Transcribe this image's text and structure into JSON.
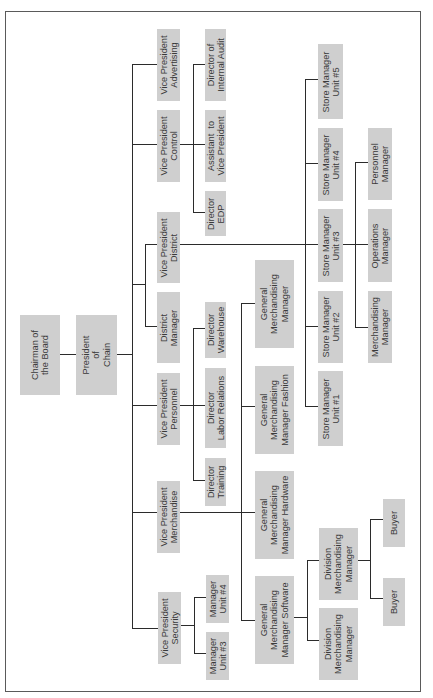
{
  "diagram": {
    "orientation": "rotated-90-ccw",
    "colors": {
      "box_fill": "#cfcfcf",
      "line": "#2b2b2b",
      "text": "#3a3a3a",
      "frame": "#5a5a5a"
    },
    "frame": {
      "x": 5,
      "y": 11,
      "w": 416,
      "h": 681
    },
    "nodes": [
      {
        "id": "chairman",
        "label": "Chairman of\nthe Board",
        "x": 20,
        "y": 315,
        "w": 40,
        "h": 80
      },
      {
        "id": "president",
        "label": "President\nof\nChain",
        "x": 76,
        "y": 315,
        "w": 41,
        "h": 80
      },
      {
        "id": "vp-advertising",
        "label": "Vice President\nAdvertising",
        "x": 157,
        "y": 29,
        "w": 23,
        "h": 72
      },
      {
        "id": "vp-control",
        "label": "Vice President\nControl",
        "x": 157,
        "y": 110,
        "w": 23,
        "h": 72
      },
      {
        "id": "vp-district",
        "label": "Vice President\nDistrict",
        "x": 157,
        "y": 212,
        "w": 23,
        "h": 71
      },
      {
        "id": "district-manager",
        "label": "District\nManager",
        "x": 157,
        "y": 292,
        "w": 23,
        "h": 71
      },
      {
        "id": "vp-personnel",
        "label": "Vice President\nPersonnel",
        "x": 157,
        "y": 373,
        "w": 23,
        "h": 72
      },
      {
        "id": "vp-merchandise",
        "label": "Vice President\nMerchandise",
        "x": 157,
        "y": 481,
        "w": 23,
        "h": 72
      },
      {
        "id": "vp-security",
        "label": "Vice President\nSecurity",
        "x": 158,
        "y": 592,
        "w": 23,
        "h": 72
      },
      {
        "id": "dir-internal-audit",
        "label": "Director of\nInternal Audit",
        "x": 205,
        "y": 29,
        "w": 21,
        "h": 72
      },
      {
        "id": "assistant-vp",
        "label": "Assistant  to\nVice President",
        "x": 205,
        "y": 110,
        "w": 21,
        "h": 72
      },
      {
        "id": "dir-edp",
        "label": "Director\nEDP",
        "x": 205,
        "y": 191,
        "w": 21,
        "h": 45
      },
      {
        "id": "dir-warehouse",
        "label": "Director\nWarehouse",
        "x": 205,
        "y": 302,
        "w": 21,
        "h": 56
      },
      {
        "id": "dir-labor",
        "label": "Director\nLabor Relations",
        "x": 205,
        "y": 368,
        "w": 21,
        "h": 80
      },
      {
        "id": "dir-training",
        "label": "Director\nTraining",
        "x": 205,
        "y": 458,
        "w": 21,
        "h": 48
      },
      {
        "id": "mgr-unit-4",
        "label": "Manager\nUnit #4",
        "x": 206,
        "y": 575,
        "w": 23,
        "h": 48
      },
      {
        "id": "mgr-unit-3",
        "label": "Manager\nUnit #3",
        "x": 206,
        "y": 632,
        "w": 23,
        "h": 48
      },
      {
        "id": "gmm",
        "label": "General\nMerchandising\nManager",
        "x": 255,
        "y": 260,
        "w": 39,
        "h": 88
      },
      {
        "id": "gmm-fashion",
        "label": "General\nMerchandising\nManager Fashion",
        "x": 255,
        "y": 366,
        "w": 39,
        "h": 88
      },
      {
        "id": "gmm-hardware",
        "label": "General\nMerchandising\nManager Hardware",
        "x": 255,
        "y": 471,
        "w": 39,
        "h": 88
      },
      {
        "id": "gmm-software",
        "label": "General\nMerchandising\nManager Software",
        "x": 255,
        "y": 576,
        "w": 39,
        "h": 88
      },
      {
        "id": "store-mgr-5",
        "label": "Store Manager\nUnit #5",
        "x": 318,
        "y": 44,
        "w": 25,
        "h": 75
      },
      {
        "id": "store-mgr-4",
        "label": "Store Manager\nUnit #4",
        "x": 318,
        "y": 128,
        "w": 25,
        "h": 73
      },
      {
        "id": "store-mgr-3",
        "label": "Store Manager\nUnit #3",
        "x": 318,
        "y": 209,
        "w": 25,
        "h": 73
      },
      {
        "id": "store-mgr-2",
        "label": "Store Manager\nUnit #2",
        "x": 318,
        "y": 291,
        "w": 25,
        "h": 72
      },
      {
        "id": "store-mgr-1",
        "label": "Store Manager\nUnit #1",
        "x": 318,
        "y": 371,
        "w": 25,
        "h": 75
      },
      {
        "id": "personnel-manager",
        "label": "Personnel\nManager",
        "x": 368,
        "y": 128,
        "w": 24,
        "h": 72
      },
      {
        "id": "operations-manager",
        "label": "Operations\nManager",
        "x": 368,
        "y": 209,
        "w": 24,
        "h": 73
      },
      {
        "id": "merchandising-manager",
        "label": "Merchandising\nManager",
        "x": 368,
        "y": 291,
        "w": 24,
        "h": 72
      },
      {
        "id": "division-mm-1",
        "label": "Division\nMerchandising\nManager",
        "x": 319,
        "y": 528,
        "w": 39,
        "h": 72
      },
      {
        "id": "division-mm-2",
        "label": "Division\nMerchandising\nManager",
        "x": 319,
        "y": 608,
        "w": 39,
        "h": 72
      },
      {
        "id": "buyer-1",
        "label": "Buyer",
        "x": 383,
        "y": 499,
        "w": 22,
        "h": 48
      },
      {
        "id": "buyer-2",
        "label": "Buyer",
        "x": 383,
        "y": 578,
        "w": 22,
        "h": 48
      }
    ],
    "lines": [
      {
        "x": 60,
        "y": 354,
        "w": 16,
        "h": 1
      },
      {
        "x": 117,
        "y": 354,
        "w": 16,
        "h": 1
      },
      {
        "x": 132,
        "y": 64,
        "w": 1,
        "h": 565
      },
      {
        "x": 132,
        "y": 64,
        "w": 25,
        "h": 1
      },
      {
        "x": 132,
        "y": 144,
        "w": 25,
        "h": 1
      },
      {
        "x": 132,
        "y": 284,
        "w": 13,
        "h": 1
      },
      {
        "x": 145,
        "y": 244,
        "w": 1,
        "h": 83
      },
      {
        "x": 145,
        "y": 244,
        "w": 12,
        "h": 1
      },
      {
        "x": 145,
        "y": 326,
        "w": 12,
        "h": 1
      },
      {
        "x": 132,
        "y": 405,
        "w": 25,
        "h": 1
      },
      {
        "x": 132,
        "y": 512,
        "w": 25,
        "h": 1
      },
      {
        "x": 132,
        "y": 628,
        "w": 26,
        "h": 1
      },
      {
        "x": 180,
        "y": 144,
        "w": 13,
        "h": 1
      },
      {
        "x": 193,
        "y": 64,
        "w": 1,
        "h": 149
      },
      {
        "x": 193,
        "y": 64,
        "w": 12,
        "h": 1
      },
      {
        "x": 193,
        "y": 144,
        "w": 12,
        "h": 1
      },
      {
        "x": 193,
        "y": 212,
        "w": 12,
        "h": 1
      },
      {
        "x": 180,
        "y": 244,
        "w": 191,
        "h": 1
      },
      {
        "x": 180,
        "y": 405,
        "w": 13,
        "h": 1
      },
      {
        "x": 193,
        "y": 328,
        "w": 1,
        "h": 153
      },
      {
        "x": 193,
        "y": 328,
        "w": 12,
        "h": 1
      },
      {
        "x": 193,
        "y": 405,
        "w": 12,
        "h": 1
      },
      {
        "x": 193,
        "y": 480,
        "w": 12,
        "h": 1
      },
      {
        "x": 180,
        "y": 512,
        "w": 75,
        "h": 1
      },
      {
        "x": 241,
        "y": 303,
        "w": 1,
        "h": 318
      },
      {
        "x": 241,
        "y": 303,
        "w": 14,
        "h": 1
      },
      {
        "x": 241,
        "y": 406,
        "w": 14,
        "h": 1
      },
      {
        "x": 241,
        "y": 620,
        "w": 14,
        "h": 1
      },
      {
        "x": 181,
        "y": 625,
        "w": 13,
        "h": 1
      },
      {
        "x": 194,
        "y": 597,
        "w": 1,
        "h": 57
      },
      {
        "x": 194,
        "y": 597,
        "w": 12,
        "h": 1
      },
      {
        "x": 194,
        "y": 653,
        "w": 12,
        "h": 1
      },
      {
        "x": 305,
        "y": 79,
        "w": 1,
        "h": 328
      },
      {
        "x": 305,
        "y": 79,
        "w": 13,
        "h": 1
      },
      {
        "x": 305,
        "y": 163,
        "w": 13,
        "h": 1
      },
      {
        "x": 305,
        "y": 326,
        "w": 13,
        "h": 1
      },
      {
        "x": 305,
        "y": 406,
        "w": 13,
        "h": 1
      },
      {
        "x": 343,
        "y": 244,
        "w": 12,
        "h": 1
      },
      {
        "x": 355,
        "y": 162,
        "w": 1,
        "h": 166
      },
      {
        "x": 355,
        "y": 162,
        "w": 13,
        "h": 1
      },
      {
        "x": 355,
        "y": 244,
        "w": 13,
        "h": 1
      },
      {
        "x": 355,
        "y": 327,
        "w": 13,
        "h": 1
      },
      {
        "x": 294,
        "y": 617,
        "w": 13,
        "h": 1
      },
      {
        "x": 307,
        "y": 560,
        "w": 1,
        "h": 81
      },
      {
        "x": 307,
        "y": 560,
        "w": 12,
        "h": 1
      },
      {
        "x": 307,
        "y": 640,
        "w": 12,
        "h": 1
      },
      {
        "x": 358,
        "y": 560,
        "w": 12,
        "h": 1
      },
      {
        "x": 370,
        "y": 519,
        "w": 1,
        "h": 80
      },
      {
        "x": 370,
        "y": 519,
        "w": 13,
        "h": 1
      },
      {
        "x": 370,
        "y": 598,
        "w": 13,
        "h": 1
      }
    ]
  }
}
